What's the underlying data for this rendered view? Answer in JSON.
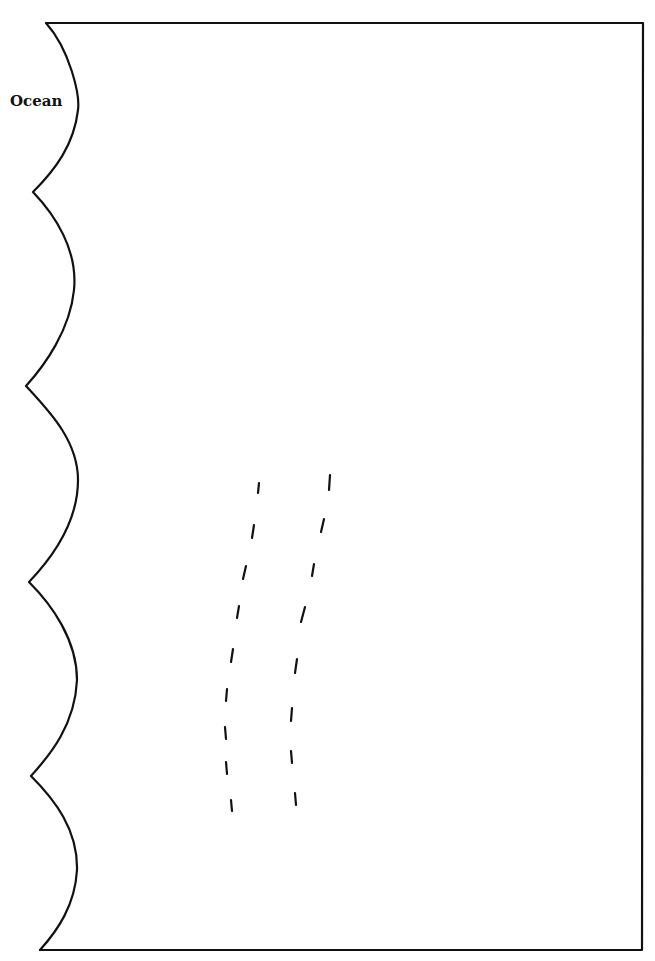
{
  "diagram": {
    "labels": {
      "ocean": "Ocean"
    },
    "colors": {
      "background": "#ffffff",
      "stroke": "#111111"
    },
    "border": {
      "top_y": 23,
      "bottom_y": 950,
      "right_x": 643
    },
    "coastline_cusps_y": [
      23,
      192,
      386,
      582,
      776,
      950
    ],
    "dashed_paths": [
      {
        "name": "left-dashed-line",
        "dashes": 9
      },
      {
        "name": "right-dashed-line",
        "dashes": 9
      }
    ]
  }
}
